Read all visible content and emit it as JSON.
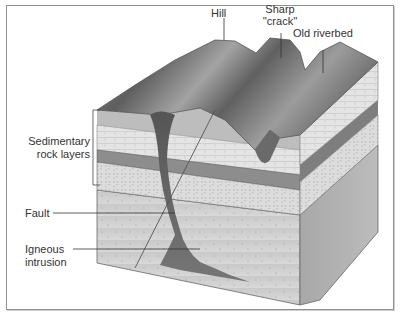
{
  "diagram": {
    "type": "geological block cross-section",
    "labels": {
      "hill": "Hill",
      "sharp_crack_line1": "Sharp",
      "sharp_crack_line2": "''crack''",
      "old_riverbed": "Old riverbed",
      "sedimentary_line1": "Sedimentary",
      "sedimentary_line2": "rock layers",
      "fault": "Fault",
      "igneous_line1": "Igneous",
      "igneous_line2": "intrusion"
    },
    "colors": {
      "frame": "#8f8f8f",
      "surface_dark": "#5a5a5a",
      "surface_light": "#9a9a9a",
      "sediment_light": "#e2e2e2",
      "sediment_dark": "#8c8c8c",
      "bedrock": "#cfcfcf",
      "intrusion": "#5e5e5e",
      "label_text": "#333333"
    }
  }
}
